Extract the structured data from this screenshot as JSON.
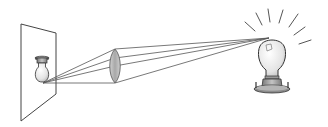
{
  "diagram": {
    "components": [
      {
        "id": "screen",
        "label": "Screen"
      },
      {
        "id": "image",
        "label": "Inverted image of bulb"
      },
      {
        "id": "lens",
        "label": "Converging lens"
      },
      {
        "id": "object",
        "label": "Light bulb (object)"
      },
      {
        "id": "rays",
        "label": "Light rays"
      }
    ],
    "colors": {
      "stroke": "#444444",
      "lens_fill": "#b8b8b8",
      "bulb_glass": "#e6e6e6",
      "bulb_base": "#9a9a9a",
      "background": "#ffffff"
    }
  }
}
